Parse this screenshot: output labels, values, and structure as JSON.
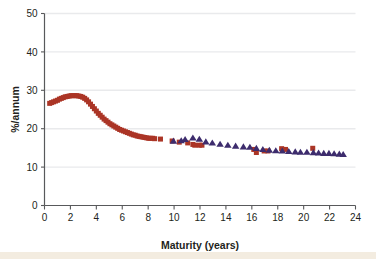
{
  "figure": {
    "background_color": "#ffffff",
    "footer_strip_color": "#f3ece0"
  },
  "chart_data": {
    "type": "scatter",
    "title": "",
    "subtitle": "",
    "xlabel": "Maturity (years)",
    "ylabel": "%/annum",
    "xlim": [
      0,
      24
    ],
    "ylim": [
      0,
      50
    ],
    "xticks": [
      0,
      2,
      4,
      6,
      8,
      10,
      12,
      14,
      16,
      18,
      20,
      22,
      24
    ],
    "yticks": [
      0,
      10,
      20,
      30,
      40,
      50
    ],
    "xtick_labels": [
      "0",
      "2",
      "4",
      "6",
      "8",
      "10",
      "12",
      "14",
      "16",
      "18",
      "20",
      "22",
      "24"
    ],
    "ytick_labels": [
      "0",
      "10",
      "20",
      "30",
      "40",
      "50"
    ],
    "grid": "horizontal-faint",
    "legend_position": "none",
    "annotations": [],
    "series": [
      {
        "name": "red-squares",
        "marker": "square",
        "color": "#ab3526",
        "marker_size": 5.0,
        "x": [
          0.4,
          0.55,
          0.7,
          0.85,
          1.0,
          1.15,
          1.3,
          1.45,
          1.6,
          1.75,
          1.9,
          2.05,
          2.2,
          2.35,
          2.5,
          2.65,
          2.8,
          2.95,
          3.1,
          3.25,
          3.4,
          3.55,
          3.7,
          3.85,
          4.0,
          4.15,
          4.3,
          4.45,
          4.6,
          4.75,
          4.9,
          5.05,
          5.2,
          5.35,
          5.5,
          5.65,
          5.8,
          5.95,
          6.1,
          6.25,
          6.4,
          6.55,
          6.7,
          6.85,
          7.0,
          7.15,
          7.3,
          7.45,
          7.6,
          7.75,
          7.9,
          8.05,
          8.2,
          8.35,
          8.5,
          8.95,
          9.85,
          10.4,
          11.05,
          11.45,
          11.6,
          11.95,
          12.15,
          16.15,
          16.35,
          16.95,
          17.25,
          18.3,
          18.6,
          20.7
        ],
        "y": [
          26.6,
          26.8,
          27.0,
          27.2,
          27.4,
          27.7,
          27.9,
          28.1,
          28.3,
          28.4,
          28.5,
          28.6,
          28.6,
          28.6,
          28.6,
          28.5,
          28.4,
          28.2,
          27.9,
          27.5,
          27.0,
          26.4,
          25.8,
          25.2,
          24.6,
          24.0,
          23.5,
          23.0,
          22.5,
          22.1,
          21.7,
          21.3,
          21.0,
          20.7,
          20.4,
          20.1,
          19.8,
          19.6,
          19.4,
          19.2,
          19.0,
          18.8,
          18.6,
          18.4,
          18.3,
          18.1,
          18.0,
          17.9,
          17.8,
          17.7,
          17.6,
          17.5,
          17.5,
          17.5,
          17.4,
          17.3,
          16.8,
          16.5,
          16.3,
          15.9,
          15.7,
          15.7,
          15.7,
          14.6,
          13.8,
          14.2,
          14.2,
          14.8,
          14.6,
          14.9
        ]
      },
      {
        "name": "navy-triangles",
        "marker": "triangle",
        "color": "#3d2c6d",
        "marker_size": 6.0,
        "x": [
          9.95,
          10.55,
          10.85,
          11.45,
          11.95,
          12.45,
          12.95,
          13.55,
          14.15,
          14.75,
          15.35,
          15.85,
          16.35,
          16.85,
          17.35,
          17.85,
          18.35,
          18.85,
          19.35,
          19.75,
          20.25,
          20.75,
          21.15,
          21.55,
          21.95,
          22.35,
          22.75,
          23.05
        ],
        "y": [
          16.8,
          16.9,
          17.2,
          17.6,
          17.3,
          16.6,
          16.3,
          16.0,
          15.7,
          15.5,
          15.3,
          15.2,
          14.9,
          14.6,
          14.4,
          14.3,
          14.2,
          14.1,
          14.0,
          13.9,
          13.9,
          13.8,
          13.7,
          13.6,
          13.6,
          13.5,
          13.4,
          13.3
        ]
      }
    ]
  }
}
